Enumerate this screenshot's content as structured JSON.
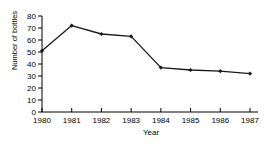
{
  "chart_data": {
    "type": "line",
    "title": "",
    "xlabel": "Year",
    "ylabel": "Number of bottles",
    "categories": [
      "1980",
      "1981",
      "1982",
      "1983",
      "1984",
      "1985",
      "1986",
      "1987"
    ],
    "values": [
      51,
      72,
      65,
      63,
      37,
      35,
      34,
      32
    ],
    "x": [
      1980,
      1981,
      1982,
      1983,
      1984,
      1985,
      1986,
      1987
    ],
    "xlim": [
      1980,
      1987
    ],
    "ylim": [
      0,
      80
    ],
    "yticks": [
      0,
      10,
      20,
      30,
      40,
      50,
      60,
      70,
      80
    ],
    "ytick_labels": [
      "0",
      "10",
      "20",
      "30",
      "40",
      "50",
      "60",
      "70",
      "80"
    ],
    "xtick_labels": [
      "1980",
      "1981",
      "1982",
      "1983",
      "1984",
      "1985",
      "1986",
      "1987"
    ],
    "grid": false,
    "legend": false,
    "marker": "diamond",
    "line_color": "#1a1a1a",
    "marker_color": "#1a1a1a",
    "axis_color": "#000000",
    "background_color": "#ffffff"
  },
  "axes": {
    "y_title": "Number of bottles",
    "x_title": "Year"
  },
  "tick_labels": {
    "y": [
      "80",
      "70",
      "60",
      "50",
      "40",
      "30",
      "20",
      "10",
      "0"
    ],
    "x": [
      "1980",
      "1981",
      "1982",
      "1983",
      "1984",
      "1985",
      "1986",
      "1987"
    ]
  },
  "header": {
    "title": ""
  }
}
